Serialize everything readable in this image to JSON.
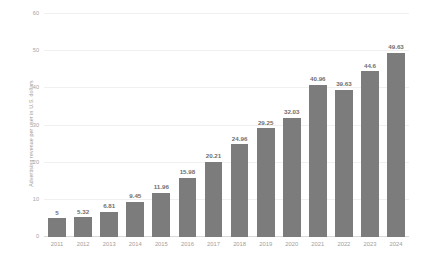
{
  "chart_data": {
    "type": "bar",
    "title": "",
    "subtitle": "",
    "xlabel": "",
    "ylabel": "Advertising revenue per user in U.S. dollars",
    "categories": [
      "2011",
      "2012",
      "2013",
      "2014",
      "2015",
      "2016",
      "2017",
      "2018",
      "2019",
      "2020",
      "2021",
      "2022",
      "2023",
      "2024"
    ],
    "values": [
      5,
      5.32,
      6.81,
      9.45,
      11.96,
      15.98,
      20.21,
      24.96,
      29.25,
      32.03,
      40.96,
      39.63,
      44.6,
      49.63
    ],
    "value_labels": [
      "5",
      "5.32",
      "6.81",
      "9.45",
      "11.96",
      "15.98",
      "20.21",
      "24.96",
      "29.25",
      "32.03",
      "40.96",
      "39.63",
      "44.6",
      "49.63"
    ],
    "ylim": [
      0,
      60
    ],
    "yticks": [
      0,
      10,
      20,
      30,
      40,
      50,
      60
    ],
    "ytick_labels": [
      "0",
      "10",
      "20",
      "30",
      "40",
      "50",
      "60"
    ],
    "grid": true,
    "legend": false,
    "legend_position": "none",
    "bar_color": "#7c7c7c",
    "gridline_color": "#f0f0f0",
    "axis_color": "#d8d8d8",
    "label_color": "#a0a0a0",
    "value_label_color": "#6e6e6e"
  }
}
